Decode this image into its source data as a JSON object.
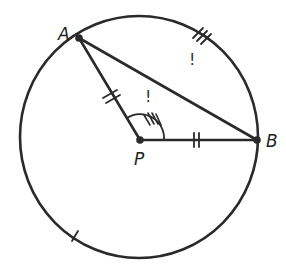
{
  "diagram": {
    "type": "circle-geometry",
    "points": {
      "A": {
        "label": "A"
      },
      "B": {
        "label": "B"
      },
      "P": {
        "label": "P"
      }
    },
    "marks": {
      "major_arc_exclamation": "!",
      "central_angle_exclamation": "!"
    },
    "colors": {
      "stroke": "#2a2a2a",
      "background": "#ffffff"
    }
  }
}
